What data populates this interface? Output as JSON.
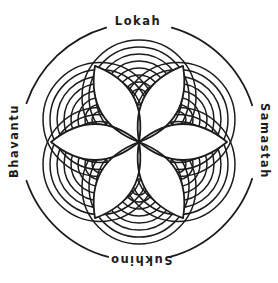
{
  "labels": {
    "top": "Lokah",
    "right": "Samastah",
    "bottom": "Sukhino",
    "left": "Bhavantu"
  },
  "colors": {
    "line": "#1c1c1c",
    "background": "#ffffff"
  },
  "mandala": {
    "center": {
      "x": 139,
      "y": 142
    },
    "text_circle": {
      "radius": 119,
      "stroke_width": 1.8,
      "gap_half_deg": {
        "top": 16,
        "right": 18,
        "bottom": 15,
        "left": 19
      }
    },
    "clusters": {
      "angles_deg": [
        90,
        30,
        330,
        270,
        210,
        150
      ],
      "center_distance": 45,
      "ring_radii": [
        8,
        15,
        22,
        29,
        36,
        43,
        50,
        57
      ],
      "stroke_width": 1.5
    },
    "petals": {
      "angles_deg": [
        0,
        60,
        120,
        180,
        240,
        300
      ],
      "length": 88,
      "control_offset": 36,
      "stroke_width": 1.8
    }
  }
}
